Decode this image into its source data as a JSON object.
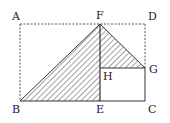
{
  "figure": {
    "type": "geometry-diagram",
    "colors": {
      "stroke": "#333333",
      "hatch": "#444444",
      "background": "#ffffff"
    },
    "points": {
      "A": {
        "label": "A",
        "x": 20,
        "y": 24
      },
      "B": {
        "label": "B",
        "x": 20,
        "y": 101
      },
      "C": {
        "label": "C",
        "x": 145,
        "y": 101
      },
      "D": {
        "label": "D",
        "x": 145,
        "y": 24
      },
      "E": {
        "label": "E",
        "x": 100,
        "y": 101
      },
      "F": {
        "label": "F",
        "x": 100,
        "y": 24
      },
      "G": {
        "label": "G",
        "x": 145,
        "y": 68
      },
      "H": {
        "label": "H",
        "x": 100,
        "y": 68
      }
    },
    "shaded_regions": [
      "triangle BFE",
      "triangle FGH"
    ],
    "dashed_segments": [
      "AB",
      "AD",
      "DG"
    ],
    "solid_segments": [
      "BC",
      "FE",
      "BF",
      "FG",
      "HG",
      "GC"
    ]
  }
}
